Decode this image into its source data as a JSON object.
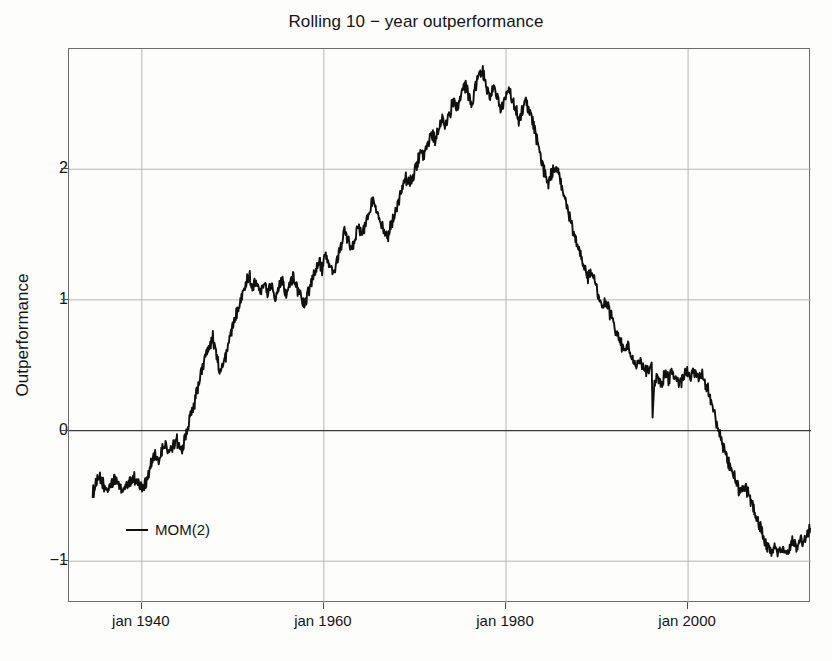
{
  "chart_data": {
    "type": "line",
    "title": "Rolling 10 − year outperformance",
    "xlabel": "",
    "ylabel": "Outperformance",
    "grid": true,
    "legend_position": "inside-lower-left",
    "xlim": [
      1932.0,
      2013.5
    ],
    "ylim": [
      -1.32,
      2.92
    ],
    "yticks": [
      -1,
      0,
      1,
      2
    ],
    "ytick_labels": [
      "-1",
      "0",
      "1",
      "2"
    ],
    "xticks": [
      1940,
      1960,
      1980,
      2000
    ],
    "xtick_labels": [
      "jan 1940",
      "jan 1960",
      "jan 1980",
      "jan 2000"
    ],
    "zero_line": 0,
    "series": [
      {
        "name": "MOM(2)",
        "color": "#101010",
        "x": [
          1934.6,
          1935.0,
          1935.4,
          1935.8,
          1936.2,
          1936.6,
          1937.0,
          1937.4,
          1937.8,
          1938.2,
          1938.6,
          1939.0,
          1939.4,
          1939.8,
          1940.2,
          1940.6,
          1941.0,
          1941.4,
          1941.8,
          1942.2,
          1942.6,
          1943.0,
          1943.4,
          1943.8,
          1944.2,
          1944.6,
          1945.0,
          1945.4,
          1945.8,
          1946.2,
          1946.6,
          1947.0,
          1947.4,
          1947.8,
          1948.2,
          1948.6,
          1949.0,
          1949.4,
          1949.8,
          1950.2,
          1950.6,
          1951.0,
          1951.4,
          1951.8,
          1952.2,
          1952.6,
          1953.0,
          1953.4,
          1953.8,
          1954.2,
          1954.6,
          1955.0,
          1955.4,
          1955.8,
          1956.2,
          1956.6,
          1957.0,
          1957.4,
          1957.8,
          1958.2,
          1958.6,
          1959.0,
          1959.4,
          1959.8,
          1960.2,
          1960.6,
          1961.0,
          1961.4,
          1961.8,
          1962.2,
          1962.6,
          1963.0,
          1963.4,
          1963.8,
          1964.2,
          1964.6,
          1965.0,
          1965.4,
          1965.8,
          1966.2,
          1966.6,
          1967.0,
          1967.4,
          1967.8,
          1968.2,
          1968.6,
          1969.0,
          1969.4,
          1969.8,
          1970.2,
          1970.6,
          1971.0,
          1971.4,
          1971.8,
          1972.2,
          1972.6,
          1973.0,
          1973.4,
          1973.8,
          1974.2,
          1974.6,
          1975.0,
          1975.4,
          1975.8,
          1976.2,
          1976.6,
          1977.0,
          1977.4,
          1977.8,
          1978.2,
          1978.6,
          1979.0,
          1979.4,
          1979.8,
          1980.2,
          1980.6,
          1981.0,
          1981.4,
          1981.8,
          1982.2,
          1982.6,
          1983.0,
          1983.4,
          1983.8,
          1984.2,
          1984.6,
          1985.0,
          1985.4,
          1985.8,
          1986.2,
          1986.6,
          1987.0,
          1987.4,
          1987.8,
          1988.2,
          1988.6,
          1989.0,
          1989.4,
          1989.8,
          1990.2,
          1990.6,
          1991.0,
          1991.4,
          1991.8,
          1992.2,
          1992.6,
          1993.0,
          1993.4,
          1993.8,
          1994.2,
          1994.6,
          1995.0,
          1995.4,
          1995.8,
          1996.0,
          1996.1,
          1996.3,
          1996.7,
          1997.1,
          1997.5,
          1997.9,
          1998.3,
          1998.7,
          1999.1,
          1999.5,
          1999.9,
          2000.3,
          2000.7,
          2001.1,
          2001.5,
          2001.9,
          2002.3,
          2002.7,
          2003.1,
          2003.5,
          2003.9,
          2004.3,
          2004.7,
          2005.1,
          2005.5,
          2005.9,
          2006.3,
          2006.7,
          2007.1,
          2007.5,
          2007.9,
          2008.3,
          2008.7,
          2009.1,
          2009.5,
          2009.9,
          2010.3,
          2010.7,
          2011.1,
          2011.5,
          2011.9,
          2012.3,
          2012.7,
          2013.1,
          2013.4
        ],
        "y": [
          -0.48,
          -0.4,
          -0.37,
          -0.42,
          -0.46,
          -0.42,
          -0.37,
          -0.41,
          -0.45,
          -0.44,
          -0.4,
          -0.36,
          -0.38,
          -0.42,
          -0.44,
          -0.36,
          -0.26,
          -0.2,
          -0.24,
          -0.16,
          -0.1,
          -0.18,
          -0.12,
          -0.06,
          -0.16,
          -0.1,
          0.02,
          0.12,
          0.22,
          0.34,
          0.46,
          0.58,
          0.66,
          0.71,
          0.58,
          0.44,
          0.52,
          0.62,
          0.74,
          0.86,
          0.96,
          1.04,
          1.13,
          1.18,
          1.1,
          1.16,
          1.07,
          1.14,
          1.04,
          1.12,
          1.03,
          1.1,
          1.16,
          1.05,
          1.11,
          1.19,
          1.1,
          1.04,
          0.96,
          1.03,
          1.12,
          1.2,
          1.3,
          1.24,
          1.33,
          1.26,
          1.2,
          1.28,
          1.4,
          1.52,
          1.46,
          1.4,
          1.47,
          1.56,
          1.5,
          1.58,
          1.68,
          1.78,
          1.7,
          1.62,
          1.52,
          1.46,
          1.58,
          1.67,
          1.74,
          1.85,
          1.93,
          1.88,
          1.95,
          2.03,
          2.12,
          2.08,
          2.18,
          2.27,
          2.22,
          2.3,
          2.4,
          2.34,
          2.42,
          2.52,
          2.46,
          2.58,
          2.66,
          2.58,
          2.5,
          2.62,
          2.72,
          2.76,
          2.64,
          2.56,
          2.62,
          2.54,
          2.46,
          2.52,
          2.6,
          2.55,
          2.48,
          2.38,
          2.45,
          2.52,
          2.44,
          2.34,
          2.22,
          2.1,
          1.98,
          1.9,
          1.96,
          2.02,
          1.95,
          1.86,
          1.74,
          1.62,
          1.5,
          1.42,
          1.34,
          1.26,
          1.18,
          1.24,
          1.12,
          1.02,
          0.94,
          1.0,
          0.9,
          0.82,
          0.74,
          0.66,
          0.6,
          0.65,
          0.57,
          0.5,
          0.54,
          0.48,
          0.44,
          0.48,
          0.52,
          0.1,
          0.35,
          0.42,
          0.36,
          0.44,
          0.38,
          0.46,
          0.4,
          0.35,
          0.41,
          0.47,
          0.42,
          0.46,
          0.4,
          0.44,
          0.36,
          0.28,
          0.18,
          0.06,
          -0.04,
          -0.13,
          -0.22,
          -0.3,
          -0.36,
          -0.44,
          -0.48,
          -0.44,
          -0.5,
          -0.58,
          -0.66,
          -0.74,
          -0.82,
          -0.88,
          -0.93,
          -0.88,
          -0.94,
          -0.89,
          -0.95,
          -0.9,
          -0.84,
          -0.89,
          -0.82,
          -0.86,
          -0.79,
          -0.75
        ]
      }
    ]
  },
  "legend": {
    "entries": [
      {
        "label": "MOM(2)",
        "marker": "line",
        "color": "#101010"
      }
    ]
  },
  "axes": {
    "y_label": "Outperformance",
    "y_tick_labels": [
      "2",
      "1",
      "0",
      "-1"
    ],
    "x_tick_labels": [
      "jan 1940",
      "jan 1960",
      "jan 1980",
      "jan 2000"
    ]
  },
  "colors": {
    "line": "#101010",
    "grid": "#b6b6b6",
    "zero_line": "#3a3a3a",
    "frame": "#6d6d6d",
    "background": "#fdfdfc",
    "text": "#141414"
  }
}
